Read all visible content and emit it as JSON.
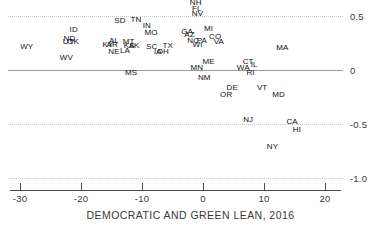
{
  "chart_data": {
    "type": "scatter",
    "title": "",
    "xlabel": "DEMOCRATIC AND GREEN LEAN, 2016",
    "ylabel": "",
    "xlim": [
      -34,
      24
    ],
    "ylim": [
      -1.08,
      0.65
    ],
    "xticks": [
      -30,
      -20,
      -10,
      0,
      10,
      20
    ],
    "xtick_labels": [
      "-30",
      "-20",
      "-10",
      "0",
      "10",
      "20"
    ],
    "yticks": [
      0.5,
      0,
      -0.5,
      -1.0
    ],
    "ytick_labels": [
      "0.5",
      "0",
      "-0.5",
      "-1.0"
    ],
    "grid": true,
    "zero_line": true,
    "legend": "none",
    "point_label_mode": "text-only",
    "points": [
      {
        "label": "NH",
        "x": -1.2,
        "y": 0.62
      },
      {
        "label": "FL",
        "x": -1.0,
        "y": 0.565
      },
      {
        "label": "NV",
        "x": -0.9,
        "y": 0.515
      },
      {
        "label": "SD",
        "x": -13.6,
        "y": 0.455
      },
      {
        "label": "TN",
        "x": -11.0,
        "y": 0.465
      },
      {
        "label": "IN",
        "x": -9.2,
        "y": 0.405
      },
      {
        "label": "ID",
        "x": -21.2,
        "y": 0.375
      },
      {
        "label": "MO",
        "x": -8.5,
        "y": 0.345
      },
      {
        "label": "MI",
        "x": 0.9,
        "y": 0.38
      },
      {
        "label": "GA",
        "x": -2.6,
        "y": 0.35
      },
      {
        "label": "AZ",
        "x": -2.2,
        "y": 0.325
      },
      {
        "label": "CO",
        "x": 2.0,
        "y": 0.31
      },
      {
        "label": "ND",
        "x": -21.9,
        "y": 0.285
      },
      {
        "label": "UT",
        "x": -22.1,
        "y": 0.255
      },
      {
        "label": "OK",
        "x": -21.3,
        "y": 0.255
      },
      {
        "label": "NC",
        "x": -1.6,
        "y": 0.27
      },
      {
        "label": "PA",
        "x": -0.2,
        "y": 0.265
      },
      {
        "label": "VA",
        "x": 2.6,
        "y": 0.26
      },
      {
        "label": "WI",
        "x": -0.9,
        "y": 0.235
      },
      {
        "label": "AL",
        "x": -14.6,
        "y": 0.265
      },
      {
        "label": "MT",
        "x": -12.2,
        "y": 0.26
      },
      {
        "label": "KY",
        "x": -15.6,
        "y": 0.235
      },
      {
        "label": "AR",
        "x": -14.9,
        "y": 0.235
      },
      {
        "label": "KS",
        "x": -12.1,
        "y": 0.225
      },
      {
        "label": "AK",
        "x": -11.3,
        "y": 0.225
      },
      {
        "label": "SC",
        "x": -8.4,
        "y": 0.215
      },
      {
        "label": "TX",
        "x": -5.8,
        "y": 0.225
      },
      {
        "label": "WY",
        "x": -28.9,
        "y": 0.215
      },
      {
        "label": "MA",
        "x": 13.0,
        "y": 0.2
      },
      {
        "label": "LA",
        "x": -12.8,
        "y": 0.175
      },
      {
        "label": "NE",
        "x": -14.6,
        "y": 0.165
      },
      {
        "label": "IA",
        "x": -7.4,
        "y": 0.17
      },
      {
        "label": "OH",
        "x": -6.6,
        "y": 0.17
      },
      {
        "label": "WV",
        "x": -22.4,
        "y": 0.115
      },
      {
        "label": "ME",
        "x": 0.9,
        "y": 0.075
      },
      {
        "label": "CT",
        "x": 7.4,
        "y": 0.07
      },
      {
        "label": "IL",
        "x": 8.4,
        "y": 0.045
      },
      {
        "label": "MN",
        "x": -1.0,
        "y": 0.02
      },
      {
        "label": "WA",
        "x": 6.6,
        "y": 0.015
      },
      {
        "label": "MS",
        "x": -11.8,
        "y": -0.03
      },
      {
        "label": "RI",
        "x": 7.8,
        "y": -0.025
      },
      {
        "label": "NM",
        "x": 0.2,
        "y": -0.075
      },
      {
        "label": "DE",
        "x": 4.8,
        "y": -0.17
      },
      {
        "label": "VT",
        "x": 9.7,
        "y": -0.165
      },
      {
        "label": "OR",
        "x": 3.8,
        "y": -0.235
      },
      {
        "label": "MD",
        "x": 12.4,
        "y": -0.235
      },
      {
        "label": "NJ",
        "x": 7.4,
        "y": -0.465
      },
      {
        "label": "CA",
        "x": 14.6,
        "y": -0.48
      },
      {
        "label": "HI",
        "x": 15.4,
        "y": -0.555
      },
      {
        "label": "NY",
        "x": 11.4,
        "y": -0.71
      }
    ]
  },
  "axis": {
    "x_title": "DEMOCRATIC AND GREEN LEAN, 2016"
  }
}
